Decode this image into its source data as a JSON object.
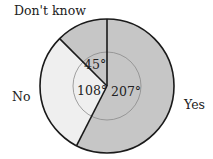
{
  "chart_data": {
    "type": "pie",
    "title": "",
    "unit": "degrees",
    "start_angle_deg": 0,
    "direction": "clockwise",
    "categories": [
      "Yes",
      "No",
      "Don't know"
    ],
    "values": [
      207,
      108,
      45
    ],
    "value_labels": [
      "207°",
      "108°",
      "45°"
    ],
    "colors": [
      "#c6c6c6",
      "#efefef",
      "#c6c6c6"
    ],
    "legend": "none (labels placed outside slices)",
    "inner_guide_circle": true
  },
  "labels": {
    "yes": "Yes",
    "no": "No",
    "dont_know": "Don't know",
    "yes_angle": "207°",
    "no_angle": "108°",
    "dont_know_angle": "45°"
  },
  "style": {
    "stroke": "#1a1a1a",
    "guide_stroke": "#8a8a8a",
    "dark_slice": "#c6c6c6",
    "light_slice": "#efefef"
  }
}
